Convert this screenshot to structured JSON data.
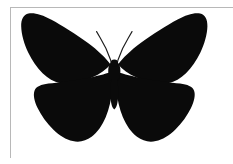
{
  "image": {
    "subject_name": "butterfly",
    "depiction": "butterfly-silhouette",
    "background_color": "#ffffff",
    "silhouette_color": "#0a0a0a",
    "border_color": "#b8b8b8",
    "orientation": "dorsal-wings-spread",
    "symmetry": "bilateral-vertical",
    "parts": [
      {
        "name": "left-forewing",
        "label": "left forewing"
      },
      {
        "name": "right-forewing",
        "label": "right forewing"
      },
      {
        "name": "left-hindwing",
        "label": "left hindwing"
      },
      {
        "name": "right-hindwing",
        "label": "right hindwing"
      },
      {
        "name": "thorax",
        "label": "thorax"
      },
      {
        "name": "abdomen",
        "label": "abdomen"
      },
      {
        "name": "left-antenna",
        "label": "left antenna"
      },
      {
        "name": "right-antenna",
        "label": "right antenna"
      }
    ],
    "bounding_box": {
      "left": 21,
      "top": 13,
      "right": 194,
      "bottom": 142
    },
    "frame": {
      "top_rule_y": 7,
      "left_rule_x": 10,
      "left_rule_bottom": 158
    },
    "caption": ""
  }
}
